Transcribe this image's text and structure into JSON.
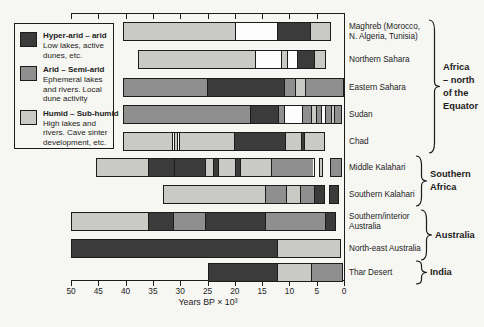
{
  "figure_background": "#f6f6f2",
  "colors": {
    "hyper_arid": "#3b3b3b",
    "arid": "#8f8f8f",
    "humid": "#c9c9c5",
    "white": "#fdfdfd",
    "line": "#1c1c1c",
    "text": "#1c1c1c"
  },
  "legend": {
    "items": [
      {
        "type": "hyper_arid",
        "title": "Hyper-arid – arid",
        "desc": "Low lakes, active dunes, etc."
      },
      {
        "type": "arid",
        "title": "Arid – Semi-arid",
        "desc": "Ephemeral lakes and rivers. Local dune activity"
      },
      {
        "type": "humid",
        "title": "Humid – Sub-humid",
        "desc": "High lakes and rivers. Cave sinter development, etc."
      }
    ]
  },
  "axis": {
    "title": "Years BP × 10³",
    "tick_labels": [
      "50",
      "45",
      "40",
      "35",
      "30",
      "25",
      "20",
      "15",
      "10",
      "5",
      "0"
    ]
  },
  "chart_data": {
    "type": "bar",
    "subtype": "horizontal-stacked-timeline",
    "title": "",
    "xlabel": "Years BP × 10³",
    "x_range": [
      50,
      0
    ],
    "x_ticks": [
      50,
      45,
      40,
      35,
      30,
      25,
      20,
      15,
      10,
      5,
      0
    ],
    "legend_classes": [
      "Hyper-arid – arid",
      "Arid – Semi-arid",
      "Humid – Sub-humid"
    ],
    "units": "thousand years before present",
    "bars": [
      {
        "label": "Maghreb (Morocco, N. Algeria, Tunisia)",
        "label_lines": [
          "Maghreb (Morocco,",
          "N. Algeria, Tunisia)"
        ],
        "group": "Africa – north of the Equator",
        "runs": [
          [
            [
              "humid",
              40.4,
              19.8
            ],
            [
              "white",
              19.8,
              11.9
            ],
            [
              "hyper_arid",
              11.9,
              5.8
            ],
            [
              "humid",
              5.8,
              2.3
            ]
          ]
        ]
      },
      {
        "label": "Northern Sahara",
        "label_lines": [
          "Northern Sahara"
        ],
        "group": "Africa – north of the Equator",
        "runs": [
          [
            [
              "humid",
              37.8,
              16.0
            ],
            [
              "white",
              16.0,
              11.2
            ],
            [
              "humid",
              11.2,
              10.1
            ],
            [
              "white",
              10.1,
              8.2
            ],
            [
              "hyper_arid",
              8.2,
              5.2
            ],
            [
              "humid",
              5.2,
              3.3
            ]
          ]
        ]
      },
      {
        "label": "Eastern Sahara",
        "label_lines": [
          "Eastern Sahara"
        ],
        "group": "Africa – north of the Equator",
        "runs": [
          [
            [
              "arid",
              40.4,
              25.0
            ],
            [
              "hyper_arid",
              25.0,
              10.7
            ],
            [
              "arid",
              10.7,
              8.7
            ],
            [
              "humid",
              8.7,
              6.8
            ],
            [
              "arid",
              6.8,
              0.0
            ]
          ]
        ]
      },
      {
        "label": "Sudan",
        "label_lines": [
          "Sudan"
        ],
        "group": "Africa – north of the Equator",
        "runs": [
          [
            [
              "arid",
              40.4,
              17.0
            ],
            [
              "hyper_arid",
              17.0,
              11.8
            ],
            [
              "arid",
              11.8,
              10.7
            ],
            [
              "white",
              10.7,
              7.4
            ],
            [
              "arid",
              7.4,
              5.7
            ],
            [
              "humid",
              5.7,
              4.7
            ],
            [
              "arid",
              4.7,
              3.8
            ],
            [
              "white",
              3.8,
              3.1
            ],
            [
              "arid",
              3.1,
              2.1
            ],
            [
              "humid",
              2.1,
              1.4
            ],
            [
              "arid",
              1.4,
              0.4
            ]
          ]
        ]
      },
      {
        "label": "Chad",
        "label_lines": [
          "Chad"
        ],
        "group": "Africa – north of the Equator",
        "runs": [
          [
            [
              "humid",
              40.4,
              31.4
            ],
            [
              "white",
              31.4,
              31.0
            ],
            [
              "humid",
              31.0,
              30.5
            ],
            [
              "white",
              30.5,
              30.1
            ],
            [
              "humid",
              30.1,
              20.0
            ],
            [
              "hyper_arid",
              20.0,
              10.5
            ],
            [
              "humid",
              10.5,
              7.5
            ],
            [
              "hyper_arid",
              7.5,
              6.9
            ],
            [
              "humid",
              6.9,
              3.5
            ]
          ]
        ]
      },
      {
        "label": "Middle Kalahari",
        "label_lines": [
          "Middle Kalahari"
        ],
        "group": "Southern Africa",
        "runs": [
          [
            [
              "humid",
              45.5,
              35.8
            ],
            [
              "hyper_arid",
              35.8,
              31.0
            ],
            [
              "hyper_arid",
              31.0,
              25.2
            ],
            [
              "humid",
              25.2,
              23.8
            ],
            [
              "hyper_arid",
              23.8,
              22.9
            ],
            [
              "humid",
              22.9,
              19.7
            ],
            [
              "hyper_arid",
              19.7,
              18.8
            ],
            [
              "humid",
              18.8,
              13.1
            ],
            [
              "arid",
              13.1,
              5.4
            ]
          ],
          [
            [
              "humid",
              4.6,
              3.8
            ]
          ],
          [
            [
              "arid",
              2.5,
              0.4
            ]
          ]
        ]
      },
      {
        "label": "Southern Kalahari",
        "label_lines": [
          "Southern Kalahari"
        ],
        "group": "Southern Africa",
        "runs": [
          [
            [
              "humid",
              33.1,
              14.2
            ],
            [
              "arid",
              14.2,
              10.3
            ],
            [
              "humid",
              10.3,
              7.8
            ],
            [
              "arid",
              7.8,
              5.2
            ],
            [
              "hyper_arid",
              5.2,
              3.5
            ]
          ],
          [
            [
              "hyper_arid",
              2.7,
              0.9
            ]
          ]
        ]
      },
      {
        "label": "Southern/interior Australia",
        "label_lines": [
          "Southern/interior",
          "Australia"
        ],
        "group": "Australia",
        "runs": [
          [
            [
              "humid",
              50.0,
              35.7
            ],
            [
              "hyper_arid",
              35.7,
              31.1
            ],
            [
              "arid",
              31.1,
              25.2
            ],
            [
              "hyper_arid",
              25.2,
              14.2
            ],
            [
              "arid",
              14.2,
              3.2
            ],
            [
              "hyper_arid",
              3.2,
              1.4
            ]
          ]
        ]
      },
      {
        "label": "North-east Australia",
        "label_lines": [
          "North-east Australia"
        ],
        "group": "Australia",
        "runs": [
          [
            [
              "hyper_arid",
              50.0,
              12.0
            ],
            [
              "humid",
              12.0,
              0.5
            ]
          ]
        ]
      },
      {
        "label": "Thar Desert",
        "label_lines": [
          "Thar Desert"
        ],
        "group": "India",
        "runs": [
          [
            [
              "hyper_arid",
              25.0,
              12.0
            ],
            [
              "humid",
              12.0,
              5.7
            ],
            [
              "arid",
              5.7,
              0.1
            ]
          ]
        ]
      }
    ],
    "groups": [
      {
        "label": "Africa – north of the Equator",
        "label_lines": [
          "Africa",
          "– north",
          "of the",
          "Equator"
        ],
        "bar_span": [
          0,
          4
        ]
      },
      {
        "label": "Southern Africa",
        "label_lines": [
          "Southern",
          "Africa"
        ],
        "bar_span": [
          5,
          6
        ]
      },
      {
        "label": "Australia",
        "label_lines": [
          "Australia"
        ],
        "bar_span": [
          7,
          8
        ]
      },
      {
        "label": "India",
        "label_lines": [
          "India"
        ],
        "bar_span": [
          9,
          9
        ]
      }
    ]
  }
}
